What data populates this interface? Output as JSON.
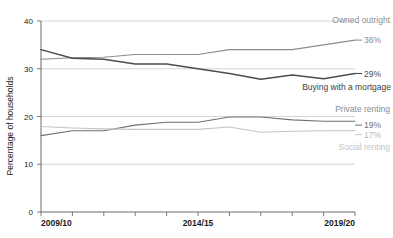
{
  "chart_data": {
    "type": "line",
    "title": "",
    "xlabel": "",
    "ylabel": "Percentage of households",
    "ylim": [
      0,
      40
    ],
    "yticks": [
      0,
      10,
      20,
      30,
      40
    ],
    "grid": true,
    "legend_position": "right-inline",
    "x": [
      "2009/10",
      "2010/11",
      "2011/12",
      "2012/13",
      "2013/14",
      "2014/15",
      "2015/16",
      "2016/17",
      "2017/18",
      "2018/19",
      "2019/20"
    ],
    "xtick_labels": [
      "2009/10",
      "2014/15",
      "2019/20"
    ],
    "series": [
      {
        "name": "Owned outright",
        "color": "#8a8d90",
        "end_label": "36%",
        "values": [
          32.0,
          32.3,
          32.4,
          33.0,
          33.0,
          33.0,
          34.0,
          34.0,
          34.0,
          35.0,
          36.0
        ]
      },
      {
        "name": "Buying with a mortgage",
        "color": "#4a4d50",
        "end_label": "29%",
        "values": [
          34.0,
          32.2,
          32.0,
          31.0,
          31.0,
          30.0,
          29.0,
          27.8,
          28.7,
          27.9,
          29.0
        ]
      },
      {
        "name": "Private renting",
        "color": "#6e7275",
        "end_label": "19%",
        "values": [
          16.0,
          17.0,
          17.0,
          18.2,
          18.8,
          18.8,
          19.9,
          19.9,
          19.3,
          19.0,
          19.0
        ]
      },
      {
        "name": "Social renting",
        "color": "#c3c6c9",
        "end_label": "17%",
        "values": [
          17.9,
          17.6,
          17.4,
          17.3,
          17.3,
          17.3,
          17.8,
          16.7,
          16.9,
          17.0,
          17.0
        ]
      }
    ]
  },
  "axis": {
    "y_tick_0": "0",
    "y_tick_10": "10",
    "y_tick_20": "20",
    "y_tick_30": "30",
    "y_tick_40": "40",
    "y_axis_title": "Percentage of households",
    "x_tick_start": "2009/10",
    "x_tick_mid": "2014/15",
    "x_tick_end": "2019/20"
  },
  "annotations": {
    "owned_outright_label": "Owned outright",
    "owned_outright_value": "36%",
    "mortgage_value": "29%",
    "mortgage_label": "Buying with a mortgage",
    "private_renting_label": "Private renting",
    "private_renting_value": "19%",
    "social_renting_value": "17%",
    "social_renting_label": "Social renting"
  },
  "colors": {
    "grid": "#c9cccf",
    "axis": "#55595c",
    "owned_outright": "#8a8d90",
    "mortgage": "#4a4d50",
    "private_renting": "#6e7275",
    "social_renting": "#c3c6c9"
  }
}
